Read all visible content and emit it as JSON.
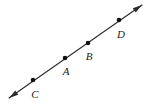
{
  "figure": {
    "type": "geometry-line-diagram",
    "background_color": "#ffffff",
    "stroke_color": "#2b2b2b",
    "dot_color": "#111111",
    "label_color": "#1a1a1a",
    "line": {
      "name": "line-CD",
      "description": "Straight line with arrowheads at both ends, extending beyond all four points",
      "start": {
        "x": 9,
        "y": 98
      },
      "end": {
        "x": 142,
        "y": 5
      },
      "slope": -0.699,
      "stroke_width": 1.1,
      "arrowheads": [
        "lower-left",
        "upper-right"
      ]
    },
    "arrow_lower_left": {
      "name": "arrowhead-lower-left",
      "tip_x": 9,
      "tip_y": 98
    },
    "arrow_upper_right": {
      "name": "arrowhead-upper-right",
      "tip_x": 142,
      "tip_y": 5
    },
    "points": [
      {
        "label": "C",
        "dot_x": 33,
        "dot_y": 80,
        "label_x": 35,
        "label_y": 94,
        "order": 1
      },
      {
        "label": "A",
        "dot_x": 65,
        "dot_y": 58,
        "label_x": 66,
        "label_y": 71,
        "order": 2
      },
      {
        "label": "B",
        "dot_x": 88,
        "dot_y": 43,
        "label_x": 89,
        "label_y": 56,
        "order": 3
      },
      {
        "label": "D",
        "dot_x": 119,
        "dot_y": 20,
        "label_x": 121,
        "label_y": 34,
        "order": 4
      }
    ],
    "dot_radius": 2.3,
    "point_order_along_line": "C, A, B, D from lower-left to upper-right"
  }
}
